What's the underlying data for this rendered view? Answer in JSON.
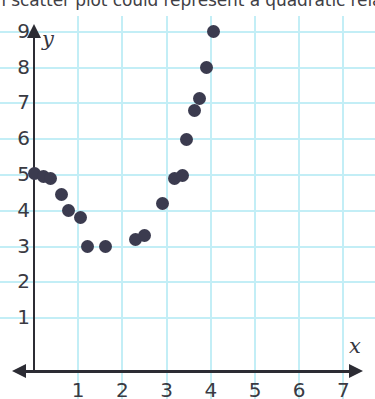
{
  "prompt": {
    "text": "Which scatter plot could represent a quadratic relation."
  },
  "colors": {
    "grid": "#c3eef6",
    "axis": "#2c2c34",
    "point": "#3b3b4f",
    "background": "#ffffff",
    "tick_text": "#3a3a42"
  },
  "chart_data": {
    "type": "scatter",
    "title": "",
    "xlabel": "x",
    "ylabel": "y",
    "xlim": [
      0,
      7.6
    ],
    "ylim": [
      0,
      9.6
    ],
    "grid": true,
    "legend": null,
    "xticks": [
      1,
      2,
      3,
      4,
      5,
      6,
      7
    ],
    "yticks": [
      1,
      2,
      3,
      4,
      5,
      6,
      7,
      8,
      9
    ],
    "xtick_labels": [
      "1",
      "2",
      "3",
      "4",
      "5",
      "6",
      "7"
    ],
    "ytick_labels": [
      "1",
      "2",
      "3",
      "4",
      "5",
      "6",
      "7",
      "8",
      "9"
    ],
    "points": [
      {
        "x": 0.02,
        "y": 5.05
      },
      {
        "x": 0.22,
        "y": 4.95
      },
      {
        "x": 0.38,
        "y": 4.9
      },
      {
        "x": 0.62,
        "y": 4.45
      },
      {
        "x": 0.78,
        "y": 4.0
      },
      {
        "x": 1.05,
        "y": 3.8
      },
      {
        "x": 1.2,
        "y": 3.0
      },
      {
        "x": 1.62,
        "y": 3.0
      },
      {
        "x": 2.3,
        "y": 3.2
      },
      {
        "x": 2.5,
        "y": 3.3
      },
      {
        "x": 2.9,
        "y": 4.2
      },
      {
        "x": 3.18,
        "y": 4.9
      },
      {
        "x": 3.35,
        "y": 5.0
      },
      {
        "x": 3.45,
        "y": 6.0
      },
      {
        "x": 3.62,
        "y": 6.8
      },
      {
        "x": 3.75,
        "y": 7.15
      },
      {
        "x": 3.9,
        "y": 8.0
      },
      {
        "x": 4.05,
        "y": 9.0
      }
    ]
  }
}
